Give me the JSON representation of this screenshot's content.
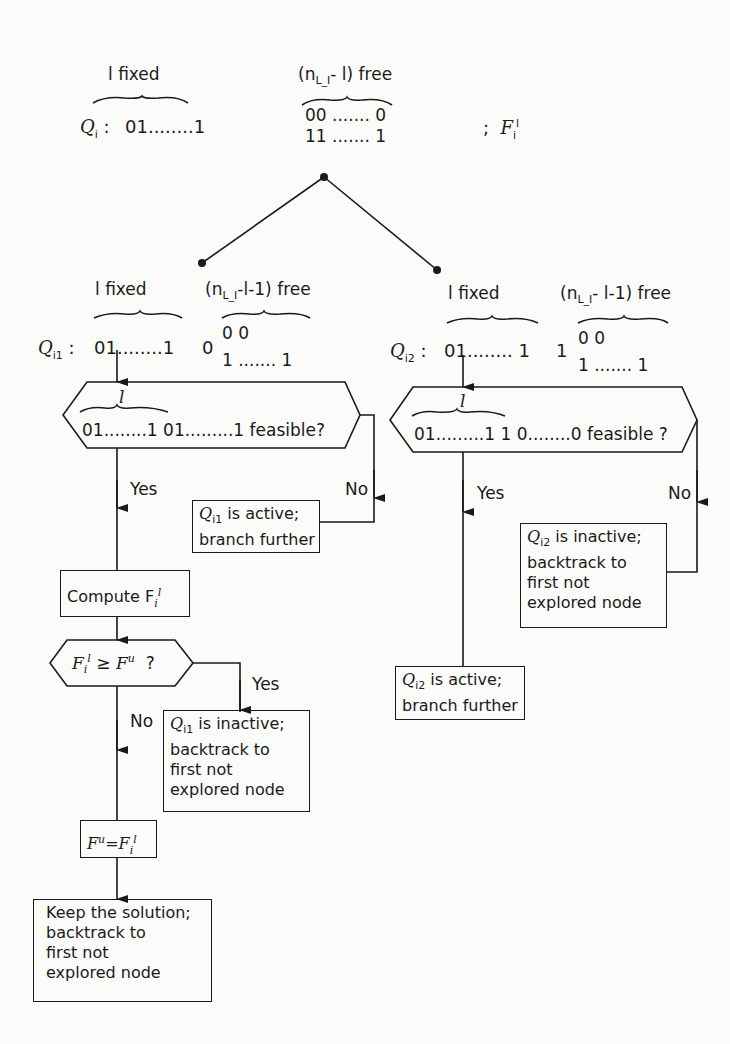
{
  "root": {
    "label": "Q",
    "label_sub": "i",
    "group_fixed": "l fixed",
    "group_free": "(n",
    "group_free_sub": "L_I",
    "group_free_tail": "- l) free",
    "fixed_bits": "01........1",
    "free_top": "00 ....... 0",
    "free_bottom": "11 ....... 1",
    "bound_sep": ";",
    "bound_label": "F",
    "bound_sub": "i",
    "bound_sup": "l"
  },
  "left_branch": {
    "group_fixed": "l fixed",
    "group_free": "(n",
    "group_free_sub": "L_I",
    "group_free_tail": "-l-1) free",
    "node_label": "Q",
    "node_sub": "i1",
    "fixed_bits": "01........1",
    "extra_bit": "0",
    "free_top": "0           0",
    "free_bottom": "1 ....... 1",
    "feasibility_check": {
      "brace_label": "l",
      "text": "01........1 01.........1 feasible?"
    },
    "yes_label": "Yes",
    "no_label": "No",
    "active_box": {
      "q": "Q",
      "q_sub": "i1",
      "line1_rest": " is active;",
      "line2": "branch further"
    },
    "compute_box": {
      "text": "Compute F",
      "sub": "i",
      "sup": "l"
    },
    "bound_check": {
      "lhs": "F",
      "lhs_sub": "i",
      "lhs_sup": "l",
      "op": "≥",
      "rhs": "F",
      "rhs_sup": "u",
      "q": "?"
    },
    "bound_yes_label": "Yes",
    "bound_no_label": "No",
    "inactive_box": {
      "q": "Q",
      "q_sub": "i1",
      "line1_rest": " is inactive;",
      "line2": "backtrack to",
      "line3": "first not",
      "line4": "explored node"
    },
    "update_box": {
      "lhs": "F",
      "lhs_sup": "u",
      "eq": "=",
      "rhs": "F",
      "rhs_sub": "i",
      "rhs_sup": "l"
    },
    "keep_box": {
      "line1": "Keep the solution;",
      "line2": "backtrack to",
      "line3": "first not",
      "line4": "explored node"
    }
  },
  "right_branch": {
    "group_fixed": "l fixed",
    "group_free": "(n",
    "group_free_sub": "L_I",
    "group_free_tail": "- l-1) free",
    "node_label": "Q",
    "node_sub": "i2",
    "fixed_bits": "01........ 1",
    "extra_bit": "1",
    "free_top": "0           0",
    "free_bottom": "1 ....... 1",
    "feasibility_check": {
      "brace_label": "l",
      "text": "01.........1 1 0........0 feasible ?"
    },
    "yes_label": "Yes",
    "no_label": "No",
    "inactive_box": {
      "q": "Q",
      "q_sub": "i2",
      "line1_rest": " is inactive;",
      "line2": "backtrack to",
      "line3": "first not",
      "line4": "explored node"
    },
    "active_box": {
      "q": "Q",
      "q_sub": "i2",
      "line1_rest": " is active;",
      "line2": "branch further"
    }
  },
  "colors": {
    "ink": "#1a1a1a",
    "paper": "#fbfbf9"
  }
}
